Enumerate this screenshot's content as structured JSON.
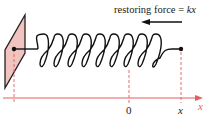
{
  "diagram": {
    "title_label": "restoring force",
    "equals": "=",
    "force_expr": "kx",
    "axis_label": "x",
    "tick_zero": "0",
    "tick_x": "x",
    "colors": {
      "wall_fill": "#f2c4c0",
      "wall_stroke": "#222222",
      "axis": "#e06060",
      "spring": "#111111",
      "arrow": "#111111"
    }
  }
}
